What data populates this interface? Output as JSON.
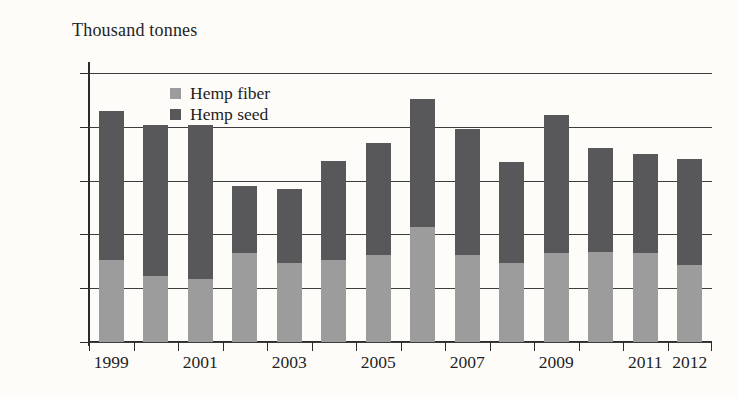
{
  "figure": {
    "axis_title": "Thousand tonnes",
    "background_color": "#fdfcf9"
  },
  "legend": {
    "items": [
      {
        "label": "Hemp fiber",
        "color": "#9c9c9c",
        "swatch_name": "legend-swatch-hemp-fiber"
      },
      {
        "label": "Hemp seed",
        "color": "#58585a",
        "swatch_name": "legend-swatch-hemp-seed"
      }
    ]
  },
  "chart_data": {
    "type": "bar",
    "stacked": true,
    "title": "",
    "subtitle": "",
    "xlabel": "",
    "ylabel": "Thousand tonnes",
    "ylim": [
      0,
      250
    ],
    "grid": true,
    "legend_position": "inside-top-left",
    "y_ticks": [
      0,
      50,
      200,
      150,
      200,
      250
    ],
    "y_tick_labels": [
      "0",
      "50",
      "200",
      "150",
      "200",
      "250"
    ],
    "y_tick_values": [
      0,
      50,
      100,
      150,
      200,
      250
    ],
    "note_on_tick_labels": "The fourth gridline from the top is labelled 200 in the source image where 100 is expected; label reproduced as printed.",
    "categories": [
      1999,
      2000,
      2001,
      2002,
      2003,
      2004,
      2005,
      2006,
      2007,
      2008,
      2009,
      2010,
      2011,
      2012
    ],
    "x_tick_labels": [
      "1999",
      "2001",
      "2003",
      "2005",
      "2007",
      "2009",
      "2011",
      "2012"
    ],
    "x_labelled_categories": [
      1999,
      2001,
      2003,
      2005,
      2007,
      2009,
      2011,
      2012
    ],
    "series": [
      {
        "name": "Hemp fiber",
        "color": "#9c9c9c",
        "values": [
          76,
          61,
          59,
          83,
          73,
          76,
          81,
          107,
          81,
          73,
          83,
          84,
          83,
          72
        ]
      },
      {
        "name": "Hemp seed",
        "color": "#58585a",
        "values": [
          139,
          141,
          143,
          62,
          69,
          92,
          104,
          119,
          117,
          94,
          128,
          96,
          92,
          98
        ]
      }
    ],
    "totals": [
      215,
      202,
      202,
      145,
      142,
      168,
      185,
      226,
      198,
      167,
      211,
      180,
      175,
      170
    ]
  }
}
